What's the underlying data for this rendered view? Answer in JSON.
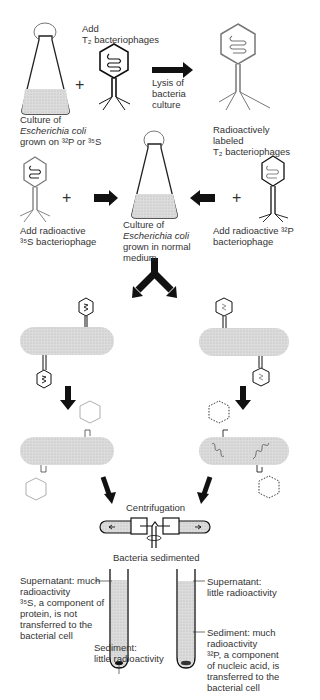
{
  "labels": {
    "add_t2": [
      "Add",
      "T₂ bacteriophages"
    ],
    "culture_top": [
      "Culture of",
      "Escherichia coli",
      "grown on ³²P or ³⁵S"
    ],
    "lysis": [
      "Lysis of",
      "bacteria",
      "culture"
    ],
    "radio_labeled": [
      "Radioactively",
      "labeled",
      "T₂ bacteriophages"
    ],
    "add_s35": [
      "Add radioactive",
      "³⁵S bacteriophage"
    ],
    "culture_mid": [
      "Culture of",
      "Escherichia coli",
      "grown in normal",
      "medium"
    ],
    "add_p32": [
      "Add radioactive ³²P",
      "bacteriophage"
    ],
    "centrifugation": "Centrifugation",
    "sedimented": "Bacteria sedimented",
    "left_supernatant": [
      "Supernatant: much",
      "radioactivity",
      "³⁵S, a component of",
      "protein, is not",
      "transferred to the",
      "bacterial cell"
    ],
    "left_sediment": [
      "Sediment:",
      "little radioactivity"
    ],
    "right_supernatant": [
      "Supernatant:",
      "little radioactivity"
    ],
    "right_sediment": [
      "Sediment: much",
      "radioactivity",
      "³²P, a component",
      "of nucleic acid, is",
      "transferred to the",
      "bacterial cell"
    ]
  },
  "colors": {
    "ink": "#111111",
    "gray_line": "#777777",
    "fill": "#d6d6d6"
  }
}
